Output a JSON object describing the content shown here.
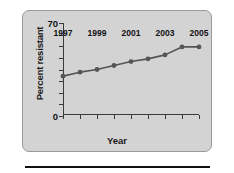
{
  "figure": {
    "panel_background": "#d3d3d3",
    "panel_border": "#9a9a9a",
    "series_color": "#555555",
    "axis_color": "#3a3a3a"
  },
  "chart_data": {
    "type": "line",
    "title": "",
    "xlabel": "Year",
    "ylabel": "Percent resistant",
    "x": [
      1997,
      1998,
      1999,
      2000,
      2001,
      2002,
      2003,
      2004,
      2005
    ],
    "values": [
      30,
      33,
      35,
      38,
      41,
      43,
      46,
      52,
      52
    ],
    "series": [
      {
        "name": "Percent resistant",
        "values": [
          30,
          33,
          35,
          38,
          41,
          43,
          46,
          52,
          52
        ]
      }
    ],
    "xlim": [
      1997,
      2005
    ],
    "ylim": [
      0,
      70
    ],
    "y_tick_values": [
      0,
      70
    ],
    "y_tick_labels": [
      "0",
      "70"
    ],
    "y_minor_tick_count": 7,
    "x_tick_values": [
      1997,
      1998,
      1999,
      2000,
      2001,
      2002,
      2003,
      2004,
      2005
    ],
    "x_tick_labels": [
      "1997",
      "",
      "1999",
      "",
      "2001",
      "",
      "2003",
      "",
      "2005"
    ],
    "grid": false,
    "legend": false,
    "marker": "circle"
  }
}
